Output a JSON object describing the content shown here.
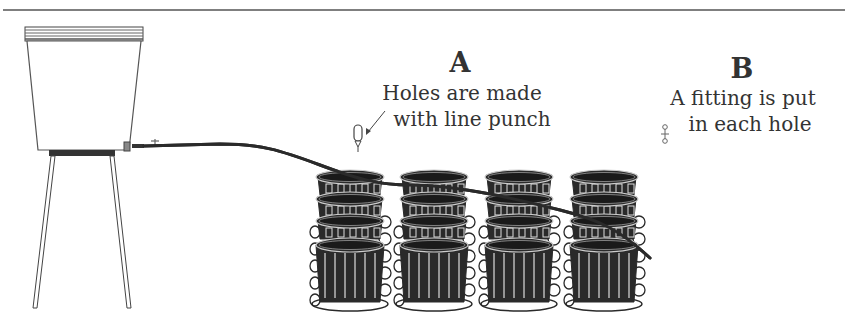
{
  "diagram": {
    "type": "gravity-fed drip irrigation setup",
    "components": [
      "bucket-reservoir-on-stand",
      "main-supply-tubing",
      "potted-plants-grid"
    ],
    "pot_grid": {
      "columns": 4,
      "rows": 4
    },
    "colors": {
      "ink": "#2a2a2a",
      "text": "#333333",
      "background": "#ffffff"
    }
  },
  "step_a": {
    "heading": "A",
    "line1": "Holes are made",
    "line2": "with line punch",
    "icon": "line-punch-icon"
  },
  "step_b": {
    "heading": "B",
    "line1": "A fitting is put",
    "line2": "in each hole",
    "icon": "barbed-fitting-icon"
  }
}
